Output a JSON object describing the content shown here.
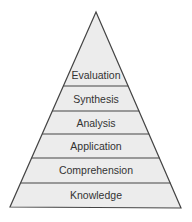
{
  "diagram": {
    "type": "pyramid",
    "title": "",
    "orientation": "apex-top",
    "colors": {
      "fill": "#ececec",
      "stroke": "#444444",
      "text": "#333333",
      "background": "#ffffff"
    },
    "levels_top_to_bottom": [
      {
        "label": "Evaluation"
      },
      {
        "label": "Synthesis"
      },
      {
        "label": "Analysis"
      },
      {
        "label": "Application"
      },
      {
        "label": "Comprehension"
      },
      {
        "label": "Knowledge"
      }
    ]
  }
}
